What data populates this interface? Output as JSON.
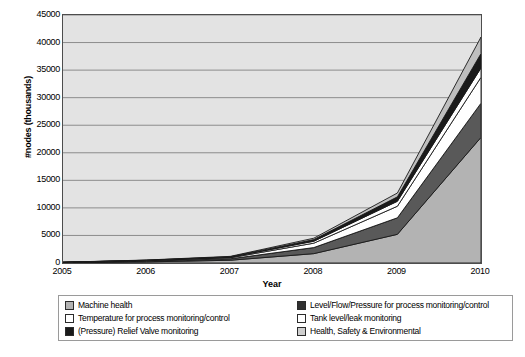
{
  "chart_data": {
    "type": "area",
    "stacked": true,
    "title": "",
    "xlabel": "Year",
    "ylabel": "#nodes (thousands)",
    "x": [
      2005,
      2006,
      2007,
      2008,
      2009,
      2010
    ],
    "xlim": [
      2005,
      2010
    ],
    "ylim": [
      0,
      45000
    ],
    "yticks": [
      0,
      5000,
      10000,
      15000,
      20000,
      25000,
      30000,
      35000,
      40000,
      45000
    ],
    "ytick_labels": [
      "0",
      "5000",
      "10000",
      "15000",
      "20000",
      "25000",
      "30000",
      "35000",
      "40000",
      "45000"
    ],
    "xtick_labels": [
      "2005",
      "2006",
      "2007",
      "2008",
      "2009",
      "2010"
    ],
    "grid": "horizontal",
    "legend_position": "bottom",
    "plot_background": "#e3e3e3",
    "series": [
      {
        "name": "Machine health",
        "color": "#b3b3b3",
        "values": [
          60,
          200,
          500,
          1700,
          5200,
          22800
        ]
      },
      {
        "name": "Level/Flow/Pressure for process monitoring/control",
        "color": "#595959",
        "values": [
          30,
          120,
          260,
          1100,
          3000,
          6200
        ]
      },
      {
        "name": "Temperature for process monitoring/control",
        "color": "#ffffff",
        "values": [
          20,
          90,
          180,
          800,
          2100,
          4700
        ]
      },
      {
        "name": "Tank level/leak monitoring",
        "color": "#ffffff",
        "values": [
          10,
          50,
          100,
          350,
          900,
          1700
        ]
      },
      {
        "name": "(Pressure) Relief Valve monitoring",
        "color": "#1a1a1a",
        "values": [
          10,
          40,
          80,
          300,
          800,
          2600
        ]
      },
      {
        "name": "Health, Safety & Environmental",
        "color": "#bfbfbf",
        "values": [
          10,
          40,
          80,
          250,
          700,
          3000
        ]
      }
    ],
    "totals": [
      140,
      540,
      1200,
      4500,
      12700,
      41000
    ]
  },
  "legend": {
    "rows": [
      {
        "left": {
          "label": "Machine health",
          "swatch": "#b3b3b3"
        },
        "right": {
          "label": "Level/Flow/Pressure for process monitoring/control",
          "swatch": "#303030"
        }
      },
      {
        "left": {
          "label": "Temperature for process monitoring/control",
          "swatch": "#ffffff"
        },
        "right": {
          "label": "Tank level/leak monitoring",
          "swatch": "#ffffff"
        }
      },
      {
        "left": {
          "label": "(Pressure) Relief Valve monitoring",
          "swatch": "#1a1a1a"
        },
        "right": {
          "label": "Health, Safety & Environmental",
          "swatch": "#cfcfcf"
        }
      }
    ]
  }
}
